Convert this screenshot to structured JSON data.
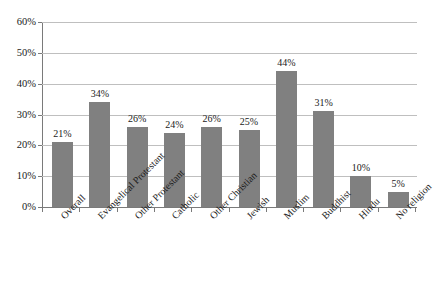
{
  "chart_data": {
    "type": "bar",
    "title": "",
    "xlabel": "",
    "ylabel": "",
    "ylim": [
      0,
      60
    ],
    "y_ticks": [
      "0%",
      "10%",
      "20%",
      "30%",
      "40%",
      "50%",
      "60%"
    ],
    "y_tick_values": [
      0,
      10,
      20,
      30,
      40,
      50,
      60
    ],
    "grid": true,
    "legend": false,
    "bar_color": "#808080",
    "gridline_color": "#bfbfbf",
    "axis_color": "#7a7a7a",
    "categories": [
      "Overall",
      "Evangelical Protestant",
      "Other Protestant",
      "Catholic",
      "Other Christian",
      "Jewish",
      "Muslim",
      "Buddhist",
      "Hindu",
      "No religion"
    ],
    "values": [
      21,
      34,
      26,
      24,
      26,
      25,
      44,
      31,
      10,
      5
    ],
    "data_labels": [
      "21%",
      "34%",
      "26%",
      "24%",
      "26%",
      "25%",
      "44%",
      "31%",
      "10%",
      "5%"
    ]
  }
}
